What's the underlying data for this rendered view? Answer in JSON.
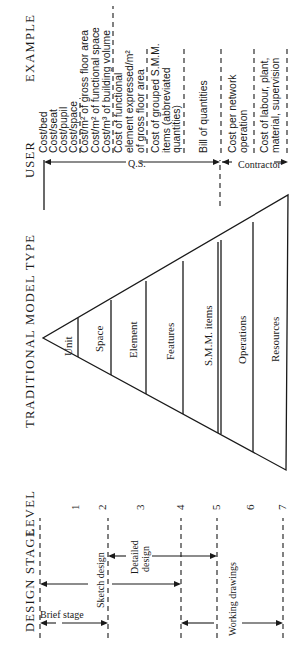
{
  "headers": {
    "design_stage": "DESIGN STAGE",
    "level": "LEVEL",
    "model_type": "TRADITIONAL MODEL TYPE",
    "user": "USER",
    "example": "EXAMPLE"
  },
  "levels": [
    "1",
    "2",
    "3",
    "4",
    "5",
    "6",
    "7"
  ],
  "design_stages": [
    {
      "label": "Brief stage",
      "from_level": "top",
      "to_level": "2"
    },
    {
      "label": "Sketch design",
      "from_level": "top",
      "to_level": "4"
    },
    {
      "label_lines": [
        "Detailed",
        "design"
      ],
      "from_level": "2",
      "to_level": "5"
    },
    {
      "label": "Working drawings",
      "from_level": "4",
      "to_level": "7"
    }
  ],
  "model_types": [
    "Unit",
    "Space",
    "Element",
    "Features",
    "S.M.M. items",
    "Operations",
    "Resources"
  ],
  "users": [
    {
      "label": "Q.S.",
      "from_level": "top",
      "to_level": "5"
    },
    {
      "label": "Contractor",
      "from_level": "5",
      "to_level": "7"
    }
  ],
  "examples": {
    "unit": [
      "Cost/bed",
      "Cost/seat",
      "Cost/pupil",
      "Cost/space"
    ],
    "space": [
      "Cost/m² of gross floor area",
      "Cost/m² of functional space",
      "Cost/m³ of building volume"
    ],
    "element": [
      "Cost of functional",
      "element expressed/m²",
      "of gross floor area"
    ],
    "features": [
      "Cost of grouped S.M.M.",
      "items (abbreviated",
      "quantities)"
    ],
    "smm": [
      "Bill of quantities"
    ],
    "operations": [
      "Cost per network",
      "operation"
    ],
    "resources": [
      "Cost of labour, plant,",
      "material, supervision"
    ]
  }
}
